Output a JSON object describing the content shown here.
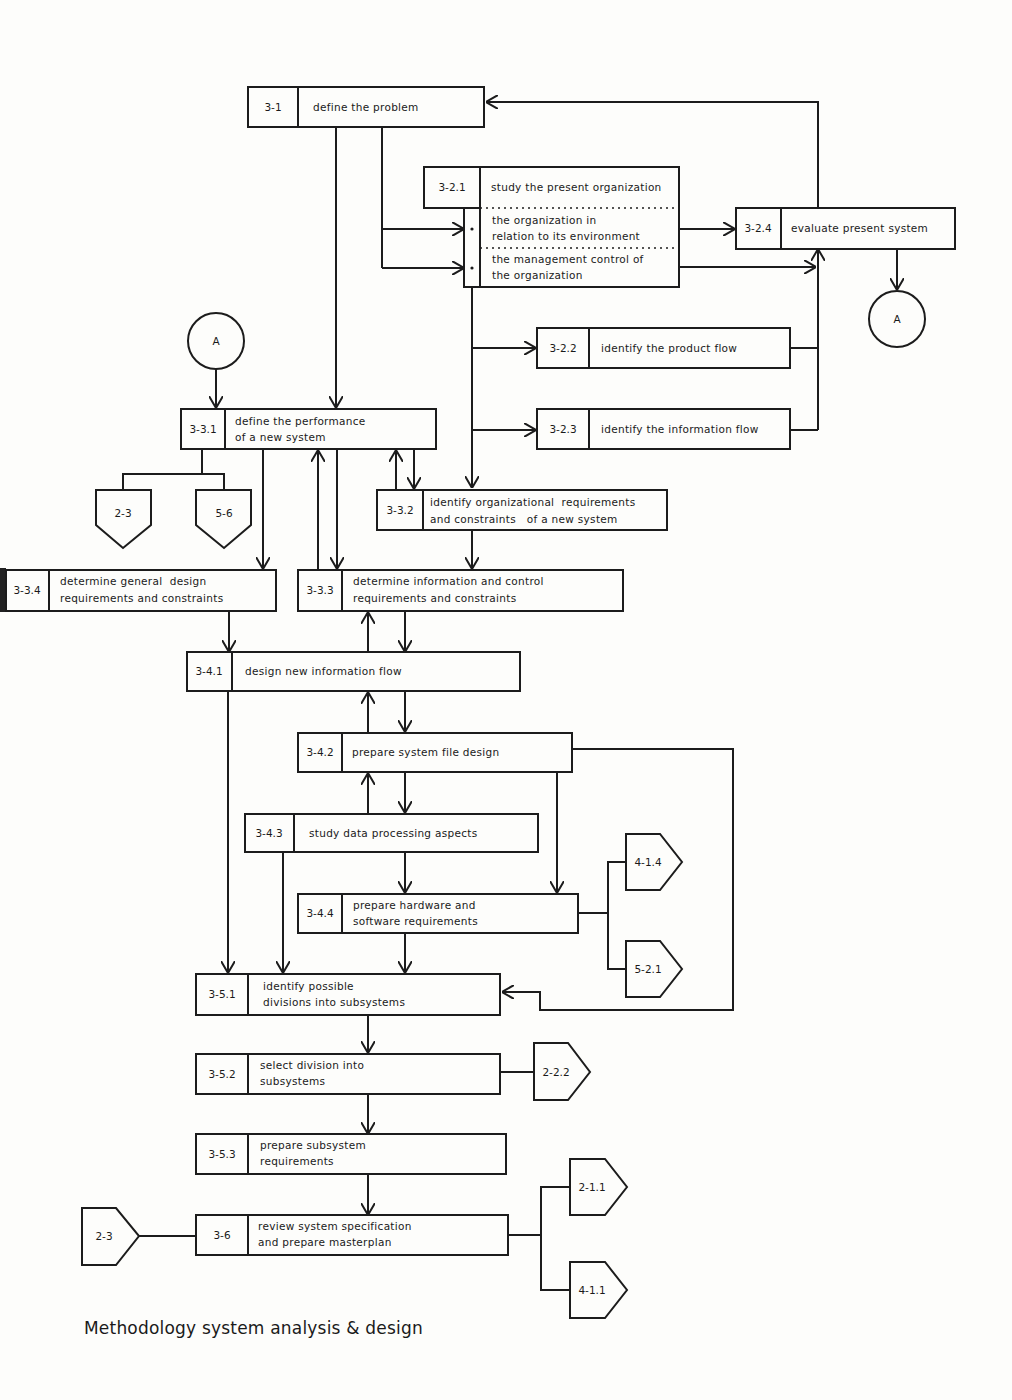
{
  "caption": "Methodology system analysis & design",
  "nodes": {
    "n3_1": {
      "id": "3-1",
      "lines": [
        "define the problem"
      ]
    },
    "n3_2_1": {
      "id": "3-2.1",
      "lines": [
        "study the present organization"
      ],
      "sub": [
        [
          "the organization in",
          "relation to its environment"
        ],
        [
          "the management control of",
          "the organization"
        ]
      ]
    },
    "n3_2_4": {
      "id": "3-2.4",
      "lines": [
        "evaluate present system"
      ]
    },
    "n3_2_2": {
      "id": "3-2.2",
      "lines": [
        "identify the product flow"
      ]
    },
    "n3_2_3": {
      "id": "3-2.3",
      "lines": [
        "identify the information flow"
      ]
    },
    "n3_3_1": {
      "id": "3-3.1",
      "lines": [
        "define the performance",
        "of a new system"
      ]
    },
    "n3_3_2": {
      "id": "3-3.2",
      "lines": [
        "identify organizational  requirements",
        "and constraints   of a new system"
      ]
    },
    "n3_3_4": {
      "id": "3-3.4",
      "lines": [
        "determine general  design",
        "requirements and constraints"
      ]
    },
    "n3_3_3": {
      "id": "3-3.3",
      "lines": [
        "determine information and control",
        "requirements and constraints"
      ]
    },
    "n3_4_1": {
      "id": "3-4.1",
      "lines": [
        "design new information flow"
      ]
    },
    "n3_4_2": {
      "id": "3-4.2",
      "lines": [
        "prepare system file design"
      ]
    },
    "n3_4_3": {
      "id": "3-4.3",
      "lines": [
        "study data processing aspects"
      ]
    },
    "n3_4_4": {
      "id": "3-4.4",
      "lines": [
        "prepare hardware and",
        "software requirements"
      ]
    },
    "n3_5_1": {
      "id": "3-5.1",
      "lines": [
        "identify possible",
        "divisions into subsystems"
      ]
    },
    "n3_5_2": {
      "id": "3-5.2",
      "lines": [
        "select division into",
        "subsystems"
      ]
    },
    "n3_5_3": {
      "id": "3-5.3",
      "lines": [
        "prepare subsystem",
        "requirements"
      ]
    },
    "n3_6": {
      "id": "3-6",
      "lines": [
        "review system specification",
        "and prepare masterplan"
      ]
    }
  },
  "connectors": {
    "circle_a_right": "A",
    "circle_a_left": "A"
  },
  "offpage": {
    "down_2_3": "2-3",
    "down_5_6": "5-6",
    "right_4_1_4": "4-1.4",
    "right_5_2_1": "5-2.1",
    "right_2_2_2": "2-2.2",
    "right_2_1_1": "2-1.1",
    "right_4_1_1": "4-1.1",
    "left_in_2_3": "2-3"
  }
}
